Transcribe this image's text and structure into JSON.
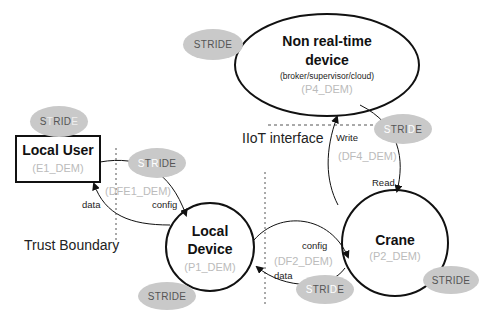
{
  "diagram": {
    "type": "threat-model data flow diagram",
    "colors": {
      "stride_fill": "#c9c9c9",
      "stride_text": "#555555",
      "masked_letter": "#ffffff",
      "id_text": "#bbbbbb",
      "line": "#111111"
    },
    "nodes": {
      "non_realtime": {
        "title_line1": "Non real-time",
        "title_line2": "device",
        "subtitle": "(broker/supervisor/cloud)",
        "id": "(P4_DEM)"
      },
      "local_user": {
        "title": "Local User",
        "id": "(E1_DEM)"
      },
      "local_device": {
        "title_line1": "Local",
        "title_line2": "Device",
        "id": "(P1_DEM)"
      },
      "crane": {
        "title": "Crane",
        "id": "(P2_DEM)"
      }
    },
    "flows": {
      "df1": {
        "id": "(DFE1_DEM)",
        "forward": "config",
        "back": "data"
      },
      "df2": {
        "id": "(DF2_DEM)",
        "forward": "config",
        "back": "data"
      },
      "df4": {
        "id": "(DF4_DEM)",
        "up": "Write",
        "down": "Read"
      }
    },
    "boundaries": {
      "trust": "Trust Boundary",
      "iiot": "IIoT interface"
    },
    "stride_badges": [
      {
        "name": "p4",
        "letters": [
          "S",
          "T",
          "R",
          "I",
          "D",
          "E"
        ],
        "masked": []
      },
      {
        "name": "e1",
        "letters": [
          "S",
          "T",
          "R",
          "I",
          "D",
          "E"
        ],
        "masked": [
          "T",
          "E"
        ]
      },
      {
        "name": "df1",
        "letters": [
          "S",
          "T",
          "R",
          "I",
          "D",
          "E"
        ],
        "masked": [
          "S",
          "R"
        ]
      },
      {
        "name": "df4",
        "letters": [
          "S",
          "T",
          "R",
          "I",
          "D",
          "E"
        ],
        "masked": [
          "S",
          "D"
        ]
      },
      {
        "name": "p1",
        "letters": [
          "S",
          "T",
          "R",
          "I",
          "D",
          "E"
        ],
        "masked": []
      },
      {
        "name": "df2",
        "letters": [
          "S",
          "T",
          "R",
          "I",
          "D",
          "E"
        ],
        "masked": [
          "S",
          "D"
        ]
      },
      {
        "name": "p2",
        "letters": [
          "S",
          "T",
          "R",
          "I",
          "D",
          "E"
        ],
        "masked": []
      }
    ]
  }
}
